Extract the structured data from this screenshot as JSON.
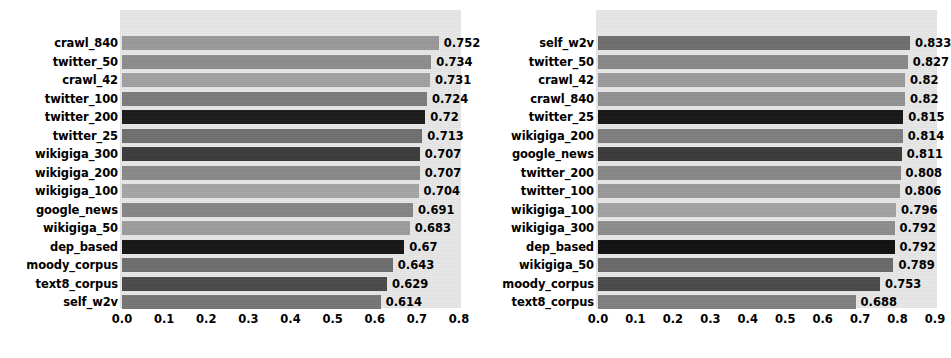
{
  "figure": {
    "background_color": "#ffffff",
    "plot_background_color": "#e9e9e9",
    "label_color": "#000000"
  },
  "chart_data": [
    {
      "type": "bar",
      "orientation": "horizontal",
      "panel": "left",
      "title": "",
      "xlabel": "",
      "ylabel": "",
      "xlim": [
        0.0,
        0.8
      ],
      "grid": false,
      "legend": "none",
      "xticklabels": [
        "0.0",
        "0.1",
        "0.2",
        "0.3",
        "0.4",
        "0.5",
        "0.6",
        "0.7",
        "0.8"
      ],
      "xticks": [
        0.0,
        0.1,
        0.2,
        0.3,
        0.4,
        0.5,
        0.6,
        0.7,
        0.8
      ],
      "categories": [
        "crawl_840",
        "twitter_50",
        "crawl_42",
        "twitter_100",
        "twitter_200",
        "twitter_25",
        "wikigiga_300",
        "wikigiga_200",
        "wikigiga_100",
        "google_news",
        "wikigiga_50",
        "dep_based",
        "moody_corpus",
        "text8_corpus",
        "self_w2v"
      ],
      "values": [
        0.752,
        0.734,
        0.731,
        0.724,
        0.72,
        0.713,
        0.707,
        0.707,
        0.704,
        0.691,
        0.683,
        0.67,
        0.643,
        0.629,
        0.614
      ],
      "value_labels": [
        "0.752",
        "0.734",
        "0.731",
        "0.724",
        "0.72",
        "0.713",
        "0.707",
        "0.707",
        "0.704",
        "0.691",
        "0.683",
        "0.67",
        "0.643",
        "0.629",
        "0.614"
      ],
      "bar_colors": [
        "#9a9a9a",
        "#8e8e8e",
        "#a2a2a2",
        "#7c7c7c",
        "#1a1a1a",
        "#707070",
        "#3b3b3b",
        "#8a8a8a",
        "#a6a6a6",
        "#868686",
        "#9e9e9e",
        "#141414",
        "#6e6e6e",
        "#4a4a4a",
        "#767676"
      ]
    },
    {
      "type": "bar",
      "orientation": "horizontal",
      "panel": "right",
      "title": "",
      "xlabel": "",
      "ylabel": "",
      "xlim": [
        0.0,
        0.9
      ],
      "grid": false,
      "legend": "none",
      "xticklabels": [
        "0.0",
        "0.1",
        "0.2",
        "0.3",
        "0.4",
        "0.5",
        "0.6",
        "0.7",
        "0.8",
        "0.9"
      ],
      "xticks": [
        0.0,
        0.1,
        0.2,
        0.3,
        0.4,
        0.5,
        0.6,
        0.7,
        0.8,
        0.9
      ],
      "categories": [
        "self_w2v",
        "twitter_50",
        "crawl_42",
        "crawl_840",
        "twitter_25",
        "wikigiga_200",
        "google_news",
        "twitter_200",
        "twitter_100",
        "wikigiga_100",
        "wikigiga_300",
        "dep_based",
        "wikigiga_50",
        "moody_corpus",
        "text8_corpus"
      ],
      "values": [
        0.833,
        0.827,
        0.82,
        0.82,
        0.815,
        0.814,
        0.811,
        0.808,
        0.806,
        0.796,
        0.792,
        0.792,
        0.789,
        0.753,
        0.688
      ],
      "value_labels": [
        "0.833",
        "0.827",
        "0.82",
        "0.82",
        "0.815",
        "0.814",
        "0.811",
        "0.808",
        "0.806",
        "0.796",
        "0.792",
        "0.792",
        "0.789",
        "0.753",
        "0.688"
      ],
      "bar_colors": [
        "#6e6e6e",
        "#8a8a8a",
        "#9c9c9c",
        "#929292",
        "#161616",
        "#7e7e7e",
        "#3a3a3a",
        "#888888",
        "#9a9a9a",
        "#a4a4a4",
        "#8e8e8e",
        "#101010",
        "#6a6a6a",
        "#4a4a4a",
        "#808080"
      ]
    }
  ],
  "geometry": {
    "left_panel": {
      "plot_x": 120,
      "plot_y": 10,
      "plot_w": 341,
      "plot_h": 298,
      "axis_x0": 122,
      "axis_x1": 459
    },
    "right_panel": {
      "plot_x": 596,
      "plot_y": 10,
      "plot_w": 341,
      "plot_h": 298,
      "axis_x0": 598,
      "axis_x1": 935
    },
    "row_height": 18.5,
    "bar_height": 14,
    "first_row_top": 36,
    "xtick_label_y": 312
  }
}
